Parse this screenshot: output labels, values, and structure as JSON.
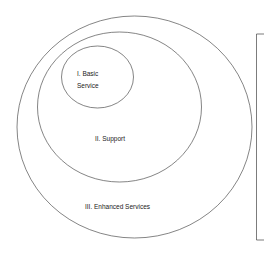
{
  "diagram": {
    "type": "nested-ellipses",
    "layers": [
      {
        "id": "basic",
        "label_line1": "I. Basic",
        "label_line2": "Service"
      },
      {
        "id": "support",
        "label": "II. Support"
      },
      {
        "id": "enhanced",
        "label": "III. Enhanced Services"
      }
    ],
    "stroke_color": "#333333"
  }
}
